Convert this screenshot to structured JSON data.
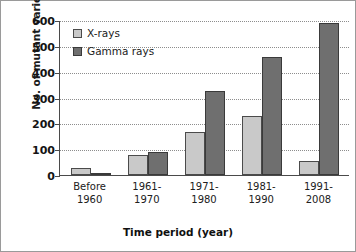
{
  "chart_data": {
    "type": "bar",
    "title": "",
    "xlabel": "Time period (year)",
    "ylabel": "No. of mutant variety",
    "ylim": [
      0,
      600
    ],
    "yticks": [
      0,
      100,
      200,
      300,
      400,
      500,
      600
    ],
    "ytick_labels": [
      "0",
      "100",
      "200",
      "300",
      "400",
      "500",
      "600"
    ],
    "grid": "horizontal-dotted",
    "legend_position": "upper-left-inside",
    "categories": [
      "Before 1960",
      "1961-1970",
      "1971-1980",
      "1981-1990",
      "1991-2008"
    ],
    "category_lines": [
      [
        "Before",
        "1960"
      ],
      [
        "1961-",
        "1970"
      ],
      [
        "1971-",
        "1980"
      ],
      [
        "1981-",
        "1990"
      ],
      [
        "1991-",
        "2008"
      ]
    ],
    "series": [
      {
        "name": "X-rays",
        "color": "#c9c9c9",
        "values": [
          28,
          77,
          165,
          228,
          55
        ]
      },
      {
        "name": "Gamma rays",
        "color": "#6f6f6f",
        "values": [
          6,
          90,
          325,
          455,
          590
        ]
      }
    ]
  },
  "legend": {
    "items": [
      {
        "label": "X-rays",
        "swatch": "legend-swatch-xrays"
      },
      {
        "label": "Gamma rays",
        "swatch": "legend-swatch-gamma-rays"
      }
    ]
  },
  "colors": {
    "xrays": "#c9c9c9",
    "gamma_rays": "#6f6f6f",
    "axis": "#4a4a4a",
    "gridline": "#8d8d8d",
    "border": "#9a9a9a",
    "text": "#1b1b1b"
  }
}
